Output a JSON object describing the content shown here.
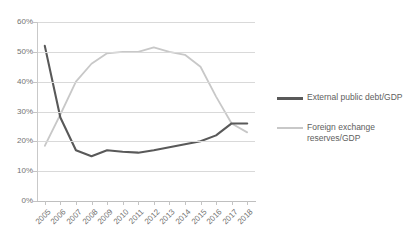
{
  "chart_data": {
    "type": "line",
    "title": "",
    "xlabel": "",
    "ylabel": "",
    "ylim": [
      0,
      60
    ],
    "ytick_labels": [
      "0%",
      "10%",
      "20%",
      "30%",
      "40%",
      "50%",
      "60%"
    ],
    "ytick_values": [
      0,
      10,
      20,
      30,
      40,
      50,
      60
    ],
    "grid": true,
    "legend_position": "right",
    "categories": [
      "2005",
      "2006",
      "2007",
      "2008",
      "2009",
      "2010",
      "2011",
      "2012",
      "2013",
      "2014",
      "2015",
      "2016",
      "2017",
      "2018"
    ],
    "series": [
      {
        "name": "External public debt/GDP",
        "color": "#595959",
        "values": [
          52.0,
          28.0,
          17.0,
          15.0,
          17.0,
          16.5,
          16.2,
          17.0,
          18.0,
          19.0,
          20.0,
          22.0,
          26.0,
          26.0
        ]
      },
      {
        "name": "Foreign exchange reserves/GDP",
        "color": "#c8c8c8",
        "values": [
          18.5,
          29.0,
          40.0,
          46.0,
          49.5,
          50.0,
          50.0,
          51.5,
          50.0,
          49.0,
          45.0,
          35.0,
          26.0,
          23.0
        ]
      }
    ]
  },
  "legend": {
    "items": [
      {
        "label": "External public debt/GDP"
      },
      {
        "label": "Foreign exchange reserves/GDP"
      }
    ]
  }
}
